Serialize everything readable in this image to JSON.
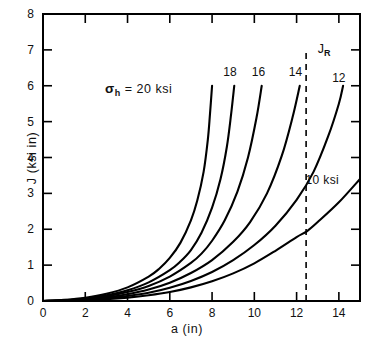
{
  "chart_data": {
    "type": "line",
    "title": "",
    "xlabel": "a (in)",
    "ylabel": "J (ksi in)",
    "xlim": [
      0,
      15
    ],
    "ylim": [
      0,
      8
    ],
    "xticks": [
      "0",
      "2",
      "4",
      "6",
      "8",
      "10",
      "12",
      "14"
    ],
    "xtick_values": [
      0,
      2,
      4,
      6,
      8,
      10,
      12,
      14
    ],
    "yticks": [
      "0",
      "1",
      "2",
      "3",
      "4",
      "5",
      "6",
      "7",
      "8"
    ],
    "ytick_values": [
      0,
      1,
      2,
      3,
      4,
      5,
      6,
      7,
      8
    ],
    "grid": false,
    "legend_position": "inline-curve-labels",
    "series": [
      {
        "name": "20 ksi",
        "label": "20",
        "x": [
          0.0,
          1.0,
          2.0,
          3.0,
          4.0,
          5.0,
          5.5,
          6.0,
          6.5,
          7.0,
          7.3,
          7.6,
          7.8,
          7.9,
          8.0
        ],
        "y": [
          0.0,
          0.03,
          0.09,
          0.2,
          0.38,
          0.68,
          0.9,
          1.2,
          1.62,
          2.25,
          2.8,
          3.6,
          4.5,
          5.2,
          6.0
        ]
      },
      {
        "name": "18 ksi",
        "label": "18",
        "x": [
          0.0,
          1.0,
          2.0,
          3.0,
          4.0,
          5.0,
          6.0,
          6.5,
          7.0,
          7.5,
          8.0,
          8.4,
          8.7,
          8.9,
          9.05
        ],
        "y": [
          0.0,
          0.02,
          0.07,
          0.16,
          0.3,
          0.52,
          0.86,
          1.1,
          1.42,
          1.9,
          2.6,
          3.4,
          4.3,
          5.2,
          6.0
        ]
      },
      {
        "name": "16 ksi",
        "label": "16",
        "x": [
          0.0,
          1.0,
          2.0,
          3.0,
          4.0,
          5.0,
          6.0,
          7.0,
          7.5,
          8.0,
          8.6,
          9.2,
          9.7,
          10.1,
          10.35
        ],
        "y": [
          0.0,
          0.018,
          0.06,
          0.13,
          0.25,
          0.42,
          0.68,
          1.06,
          1.32,
          1.68,
          2.25,
          3.05,
          4.0,
          5.1,
          6.0
        ]
      },
      {
        "name": "14 ksi",
        "label": "14",
        "x": [
          0.0,
          1.0,
          2.0,
          3.0,
          4.0,
          5.0,
          6.0,
          7.0,
          8.0,
          9.0,
          9.8,
          10.6,
          11.3,
          11.8,
          12.15
        ],
        "y": [
          0.0,
          0.014,
          0.05,
          0.1,
          0.19,
          0.32,
          0.51,
          0.78,
          1.14,
          1.65,
          2.2,
          3.0,
          4.05,
          5.1,
          6.0
        ]
      },
      {
        "name": "12 ksi",
        "label": "12",
        "x": [
          0.0,
          1.0,
          2.0,
          3.0,
          4.0,
          5.0,
          6.0,
          7.0,
          8.0,
          9.0,
          10.0,
          11.0,
          12.0,
          12.8,
          13.5,
          14.0,
          14.2
        ],
        "y": [
          0.0,
          0.01,
          0.035,
          0.075,
          0.14,
          0.23,
          0.37,
          0.56,
          0.81,
          1.14,
          1.56,
          2.1,
          2.82,
          3.6,
          4.6,
          5.5,
          6.0
        ]
      },
      {
        "name": "10 ksi",
        "label": "10 ksi",
        "x": [
          0.0,
          1.0,
          2.0,
          3.0,
          4.0,
          5.0,
          6.0,
          7.0,
          8.0,
          9.0,
          10.0,
          11.0,
          12.0,
          12.5,
          13.0,
          14.0,
          15.0
        ],
        "y": [
          0.0,
          0.007,
          0.025,
          0.052,
          0.095,
          0.16,
          0.25,
          0.38,
          0.55,
          0.77,
          1.05,
          1.4,
          1.78,
          1.95,
          2.2,
          2.75,
          3.4
        ]
      }
    ],
    "annotations": [
      {
        "name": "sigma-h-label",
        "text": "σ_h = 20 ksi",
        "sigma": "σ",
        "subscript": "h",
        "equals_text": "= 20 ksi",
        "x": 5.4,
        "y": 5.9
      },
      {
        "name": "jr-label",
        "text": "J_R",
        "base": "J",
        "subscript": "R",
        "x": 13.0,
        "y": 7.0
      },
      {
        "name": "curve-label-18",
        "text": "18",
        "x": 8.85,
        "y": 6.35
      },
      {
        "name": "curve-label-16",
        "text": "16",
        "x": 10.2,
        "y": 6.35
      },
      {
        "name": "curve-label-14",
        "text": "14",
        "x": 11.95,
        "y": 6.35
      },
      {
        "name": "curve-label-12",
        "text": "12",
        "x": 14.0,
        "y": 6.2
      },
      {
        "name": "ten-ksi-label",
        "text": "10 ksi",
        "x": 12.7,
        "y": 3.35
      }
    ],
    "reference_line": {
      "name": "J_R dashed vertical line",
      "orientation": "vertical",
      "x_value": 12.45,
      "y_from": 0,
      "y_to": 7.05,
      "style": "dashed",
      "label": "J_R"
    },
    "line_color": "#000000",
    "axis_color": "#000000",
    "background_color": "#ffffff"
  }
}
